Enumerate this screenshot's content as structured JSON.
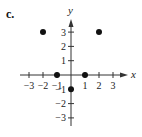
{
  "panel_label": "c.",
  "chart_data": {
    "type": "scatter",
    "title": "",
    "xlabel": "x",
    "ylabel": "y",
    "xlim": [
      -3,
      3
    ],
    "ylim": [
      -3,
      3
    ],
    "grid": false,
    "x_ticks": [
      -3,
      -2,
      -1,
      1,
      2,
      3
    ],
    "y_ticks": [
      3,
      2,
      1,
      -1,
      -2,
      -3
    ],
    "x_tick_labels": [
      "−3",
      "−2",
      "−1",
      "1",
      "2",
      "3"
    ],
    "y_tick_labels": [
      "3",
      "2",
      "1",
      "−1",
      "−2",
      "−3"
    ],
    "series": [
      {
        "name": "points",
        "points": [
          {
            "x": -2,
            "y": 3
          },
          {
            "x": 2,
            "y": 3
          },
          {
            "x": -1,
            "y": 0
          },
          {
            "x": 1,
            "y": 0
          },
          {
            "x": 0,
            "y": -1
          }
        ]
      }
    ],
    "colors": {
      "points": "#111111",
      "axes": "#333333"
    }
  }
}
